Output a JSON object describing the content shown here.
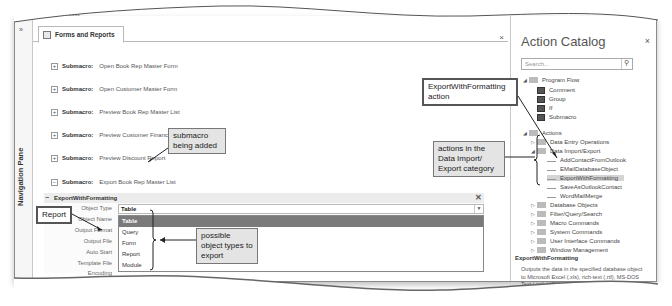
{
  "window": {
    "ribbon_hint": "Tools",
    "document_tab": "Forms and Reports",
    "navigation_pane_label": "Navigation Pane",
    "shutter_glyph": "»",
    "close_glyph": "×"
  },
  "submacros": [
    {
      "keyword": "Submacro:",
      "name": "Open Book Rep Master Form",
      "expander": "+"
    },
    {
      "keyword": "Submacro:",
      "name": "Open Customer Master Form",
      "expander": "+"
    },
    {
      "keyword": "Submacro:",
      "name": "Preview Book Rep Master List",
      "expander": "+"
    },
    {
      "keyword": "Submacro:",
      "name": "Preview Customer Financial Report",
      "expander": "+"
    },
    {
      "keyword": "Submacro:",
      "name": "Preview Discount Report",
      "expander": "+"
    },
    {
      "keyword": "Submacro:",
      "name": "Export Book Rep Master List",
      "expander": "−"
    }
  ],
  "action": {
    "name": "ExportWithFormatting",
    "expander": "−",
    "arguments": [
      {
        "label": "Object Type",
        "value": "Table"
      },
      {
        "label": "Object Name",
        "value": ""
      },
      {
        "label": "Output Format",
        "value": ""
      },
      {
        "label": "Output File",
        "value": ""
      },
      {
        "label": "Auto Start",
        "value": ""
      },
      {
        "label": "Template File",
        "value": ""
      },
      {
        "label": "Encoding",
        "value": ""
      },
      {
        "label": "Output Quality",
        "value": "Print"
      }
    ],
    "dropdown_options": [
      "Table",
      "Query",
      "Form",
      "Report",
      "Module",
      "Server View",
      "Stored Procedure",
      "Function"
    ],
    "dropdown_highlighted": "Table"
  },
  "catalog": {
    "title": "Action Catalog",
    "search_placeholder": "Search...",
    "tree": [
      {
        "label": "Program Flow",
        "level": 0,
        "type": "folder",
        "expanded": true
      },
      {
        "label": "Comment",
        "level": 1,
        "type": "action"
      },
      {
        "label": "Group",
        "level": 1,
        "type": "action"
      },
      {
        "label": "If",
        "level": 1,
        "type": "action"
      },
      {
        "label": "Submacro",
        "level": 1,
        "type": "action"
      },
      {
        "label": "Actions",
        "level": 0,
        "type": "folder",
        "expanded": true
      },
      {
        "label": "Data Entry Operations",
        "level": 1,
        "type": "folder",
        "expanded": false
      },
      {
        "label": "Data Import/Export",
        "level": 1,
        "type": "folder",
        "expanded": true
      },
      {
        "label": "AddContactFromOutlook",
        "level": 2,
        "type": "leaf"
      },
      {
        "label": "EMailDatabaseObject",
        "level": 2,
        "type": "leaf"
      },
      {
        "label": "ExportWithFormatting",
        "level": 2,
        "type": "leaf",
        "selected": true
      },
      {
        "label": "SaveAsOutlookContact",
        "level": 2,
        "type": "leaf"
      },
      {
        "label": "WordMailMerge",
        "level": 2,
        "type": "leaf"
      },
      {
        "label": "Database Objects",
        "level": 1,
        "type": "folder",
        "expanded": false
      },
      {
        "label": "Filter/Query/Search",
        "level": 1,
        "type": "folder",
        "expanded": false
      },
      {
        "label": "Macro Commands",
        "level": 1,
        "type": "folder",
        "expanded": false
      },
      {
        "label": "System Commands",
        "level": 1,
        "type": "folder",
        "expanded": false
      },
      {
        "label": "User Interface Commands",
        "level": 1,
        "type": "folder",
        "expanded": false
      },
      {
        "label": "Window Management",
        "level": 1,
        "type": "folder",
        "expanded": false
      }
    ],
    "description_title": "ExportWithFormatting",
    "description_text": "Outputs the data in the specified database object to Microsoft Excel (.xls), rich-text (.rtf), MS-DOS Text (.txt), HTML (.htm) or"
  },
  "callouts": {
    "submacro_added": "submacro being added",
    "report": "Report",
    "object_types": "possible object types to export",
    "export_action": "ExportWithFormatting action",
    "import_export_category": "actions in the Data Import/ Export category"
  }
}
